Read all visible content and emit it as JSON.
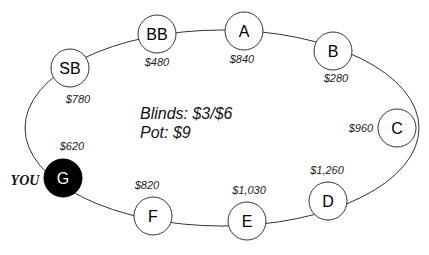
{
  "table": {
    "blinds_text": "Blinds: $3/$6",
    "pot_text": "Pot: $9",
    "you_label": "YOU",
    "colors": {
      "seat_fill": "#ffffff",
      "hero_fill": "#000000",
      "stroke": "#333333"
    }
  },
  "seats": [
    {
      "name": "SB",
      "stack": "$780",
      "hero": false
    },
    {
      "name": "BB",
      "stack": "$480",
      "hero": false
    },
    {
      "name": "A",
      "stack": "$840",
      "hero": false
    },
    {
      "name": "B",
      "stack": "$280",
      "hero": false
    },
    {
      "name": "C",
      "stack": "$960",
      "hero": false
    },
    {
      "name": "D",
      "stack": "$1,260",
      "hero": false
    },
    {
      "name": "E",
      "stack": "$1,030",
      "hero": false
    },
    {
      "name": "F",
      "stack": "$820",
      "hero": false
    },
    {
      "name": "G",
      "stack": "$620",
      "hero": true
    }
  ]
}
